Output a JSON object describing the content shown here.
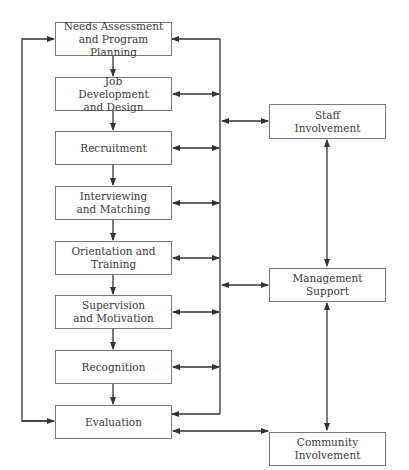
{
  "diagram": {
    "process_steps": [
      {
        "id": "needs",
        "label": "Needs Assessment and Program Planning"
      },
      {
        "id": "jobdev",
        "label": "Job Development and Design"
      },
      {
        "id": "recruit",
        "label": "Recruitment"
      },
      {
        "id": "interview",
        "label": "Interviewing and Matching"
      },
      {
        "id": "orient",
        "label": "Orientation and Training"
      },
      {
        "id": "supervise",
        "label": "Supervision and Motivation"
      },
      {
        "id": "recog",
        "label": "Recognition"
      },
      {
        "id": "eval",
        "label": "Evaluation"
      }
    ],
    "support_factors": [
      {
        "id": "staff",
        "label": "Staff Involvement"
      },
      {
        "id": "mgmt",
        "label": "Management Support"
      },
      {
        "id": "community",
        "label": "Community Involvement"
      }
    ],
    "colors": {
      "line": "#333333",
      "border": "#7a7a7a",
      "text": "#3a3a3a"
    }
  }
}
